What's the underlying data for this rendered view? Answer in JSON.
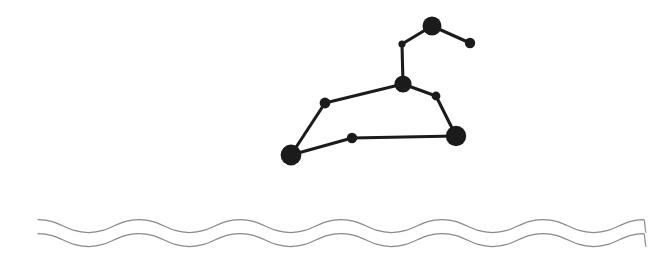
{
  "figure": {
    "type": "illustration",
    "width": 657,
    "height": 265,
    "background_color": "#ffffff"
  },
  "constellation": {
    "name": "constellation-diagram",
    "star_color": "#1b1b1b",
    "link_color": "#1b1b1b",
    "link_width": 3.1,
    "stars": [
      {
        "id": "top-bright",
        "label": "top-bright-star",
        "x": 432,
        "y": 26,
        "r": 9.5,
        "size": "large"
      },
      {
        "id": "top-right-small",
        "label": "top-right-small-star",
        "x": 470,
        "y": 43,
        "r": 5.2,
        "size": "small"
      },
      {
        "id": "upper-tiny",
        "label": "upper-tiny-star",
        "x": 402,
        "y": 44,
        "r": 3.6,
        "size": "tiny"
      },
      {
        "id": "hub",
        "label": "central-hub-star",
        "x": 403,
        "y": 84,
        "r": 8.6,
        "size": "large"
      },
      {
        "id": "right-mid-small",
        "label": "right-mid-small-star",
        "x": 436,
        "y": 96,
        "r": 4.4,
        "size": "small"
      },
      {
        "id": "right-bright",
        "label": "lower-right-bright-star",
        "x": 456,
        "y": 136,
        "r": 10.2,
        "size": "large"
      },
      {
        "id": "left-mid-small",
        "label": "left-mid-small-star",
        "x": 325,
        "y": 103,
        "r": 5.4,
        "size": "small"
      },
      {
        "id": "left-bright",
        "label": "lower-left-bright-star",
        "x": 291,
        "y": 155,
        "r": 10.4,
        "size": "large"
      },
      {
        "id": "bottom-mid-small",
        "label": "bottom-middle-small-star",
        "x": 352,
        "y": 138,
        "r": 5.2,
        "size": "small"
      }
    ],
    "links": [
      {
        "from": "upper-tiny",
        "to": "top-bright"
      },
      {
        "from": "top-bright",
        "to": "top-right-small"
      },
      {
        "from": "upper-tiny",
        "to": "hub"
      },
      {
        "from": "hub",
        "to": "right-mid-small"
      },
      {
        "from": "right-mid-small",
        "to": "right-bright"
      },
      {
        "from": "hub",
        "to": "left-mid-small"
      },
      {
        "from": "left-mid-small",
        "to": "left-bright"
      },
      {
        "from": "left-bright",
        "to": "bottom-mid-small"
      },
      {
        "from": "bottom-mid-small",
        "to": "right-bright"
      }
    ]
  },
  "waves": {
    "name": "water-waves",
    "color": "#8a8a8a",
    "stroke_width": 1.25,
    "x_start": 38,
    "x_end": 646,
    "period": 101,
    "amplitude": 6.5,
    "lines": [
      {
        "id": "wave-upper",
        "label": "upper-wave-line",
        "baseline_y": 226,
        "phase": 0
      },
      {
        "id": "wave-lower",
        "label": "lower-wave-line",
        "baseline_y": 240,
        "phase": 0
      }
    ]
  }
}
